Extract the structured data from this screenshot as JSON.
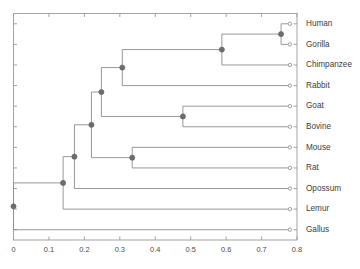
{
  "chart_data": {
    "type": "dendrogram",
    "title": "",
    "xlabel": "",
    "ylabel": "",
    "xlim": [
      0.0,
      0.8
    ],
    "xticks": [
      0.0,
      0.1,
      0.2,
      0.3,
      0.4,
      0.5,
      0.6,
      0.7,
      0.8
    ],
    "xtick_labels": [
      "0",
      "0.1",
      "0.2",
      "0.3",
      "0.4",
      "0.5",
      "0.6",
      "0.7",
      "0.8"
    ],
    "grid": false,
    "legend": null,
    "leaf_labels": [
      "Human",
      "Gorilla",
      "Chimpanzee",
      "Rabbit",
      "Goat",
      "Bovine",
      "Mouse",
      "Rat",
      "Opossum",
      "Lemur",
      "Gallus"
    ],
    "leaf_tip_value": 0.78,
    "merge_nodes": [
      {
        "id": "n1",
        "label": "Human + Gorilla",
        "height": 0.755,
        "members": [
          "Human",
          "Gorilla"
        ]
      },
      {
        "id": "n2",
        "label": "(Human,Gorilla) + Chimpanzee",
        "height": 0.588,
        "members": [
          "Human",
          "Gorilla",
          "Chimpanzee"
        ]
      },
      {
        "id": "n3",
        "label": "Goat + Bovine",
        "height": 0.478,
        "members": [
          "Goat",
          "Bovine"
        ]
      },
      {
        "id": "n4",
        "label": "Mouse + Rat",
        "height": 0.335,
        "members": [
          "Mouse",
          "Rat"
        ]
      },
      {
        "id": "n5",
        "label": "Primates + Rabbit",
        "height": 0.307,
        "members": [
          "Human",
          "Gorilla",
          "Chimpanzee",
          "Rabbit"
        ]
      },
      {
        "id": "n6",
        "label": "PrimatesRabbit + GoatBovine",
        "height": 0.248,
        "members": [
          "Human",
          "Gorilla",
          "Chimpanzee",
          "Rabbit",
          "Goat",
          "Bovine"
        ]
      },
      {
        "id": "n7",
        "label": "Mammals + Rodents",
        "height": 0.22,
        "members": [
          "Human",
          "Gorilla",
          "Chimpanzee",
          "Rabbit",
          "Goat",
          "Bovine",
          "Mouse",
          "Rat"
        ]
      },
      {
        "id": "n8",
        "label": "Mammals + Opossum",
        "height": 0.172,
        "members": [
          "Human",
          "Gorilla",
          "Chimpanzee",
          "Rabbit",
          "Goat",
          "Bovine",
          "Mouse",
          "Rat",
          "Opossum"
        ]
      },
      {
        "id": "n9",
        "label": "Mammals + Lemur",
        "height": 0.14,
        "members": [
          "Human",
          "Gorilla",
          "Chimpanzee",
          "Rabbit",
          "Goat",
          "Bovine",
          "Mouse",
          "Rat",
          "Opossum",
          "Lemur"
        ]
      },
      {
        "id": "n10",
        "label": "Root: All + Gallus",
        "height": 0.0,
        "members": [
          "Human",
          "Gorilla",
          "Chimpanzee",
          "Rabbit",
          "Goat",
          "Bovine",
          "Mouse",
          "Rat",
          "Opossum",
          "Lemur",
          "Gallus"
        ]
      }
    ],
    "colors": {
      "link": "#8c8c8c",
      "merge_node": "#6d6d6d",
      "leaf_node_fill": "#ffffff",
      "leaf_node_stroke": "#8c8c8c",
      "axis": "#9a9a9a",
      "text": "#3d3d3d",
      "background": "#ffffff"
    }
  }
}
